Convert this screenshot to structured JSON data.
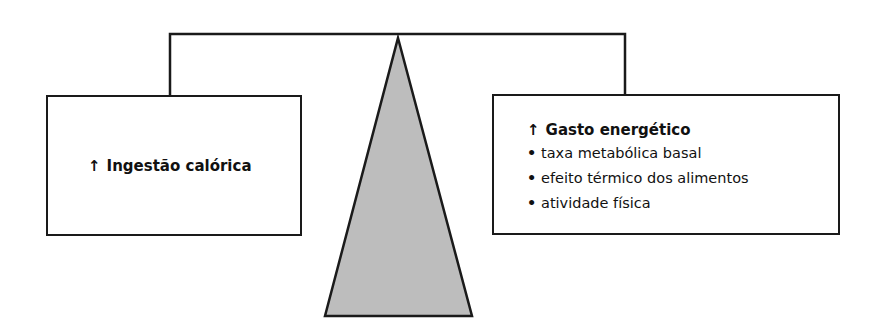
{
  "diagram": {
    "title_concept": "Balança energética",
    "left_box": {
      "arrow_icon": "up-arrow",
      "arrow_glyph": "↑",
      "label": "Ingestão calórica"
    },
    "right_box": {
      "arrow_icon": "up-arrow",
      "arrow_glyph": "↑",
      "heading": "Gasto energético",
      "bullet_glyph": "•",
      "items": [
        "taxa metabólica basal",
        "efeito térmico dos alimentos",
        "atividade física"
      ]
    },
    "colors": {
      "stroke": "#1a1a1a",
      "fulcrum_fill": "#bdbdbd",
      "background": "#ffffff"
    }
  }
}
